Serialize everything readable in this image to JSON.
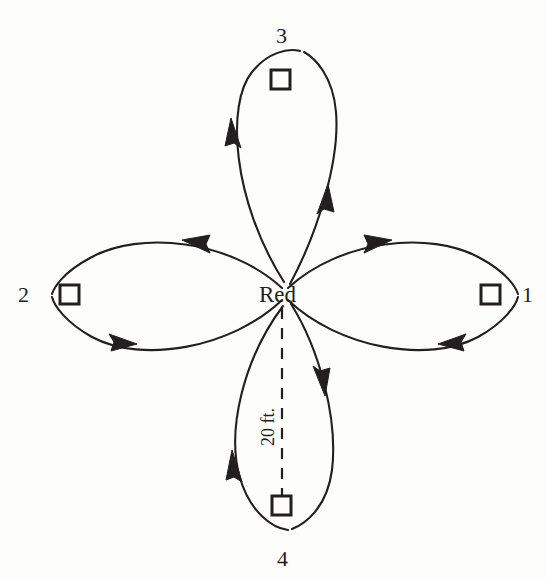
{
  "diagram": {
    "hub": {
      "label": "Red"
    },
    "distance_annotation": {
      "label": "20 ft."
    },
    "stations": [
      {
        "id": "1",
        "label": "1",
        "direction": "east",
        "circulation": "clockwise"
      },
      {
        "id": "2",
        "label": "2",
        "direction": "west",
        "circulation": "counterclockwise"
      },
      {
        "id": "3",
        "label": "3",
        "direction": "north",
        "circulation": "counterclockwise"
      },
      {
        "id": "4",
        "label": "4",
        "direction": "south",
        "circulation": "clockwise"
      }
    ],
    "colors": {
      "ink": "#231f20",
      "background": "#fdfdfb"
    }
  }
}
